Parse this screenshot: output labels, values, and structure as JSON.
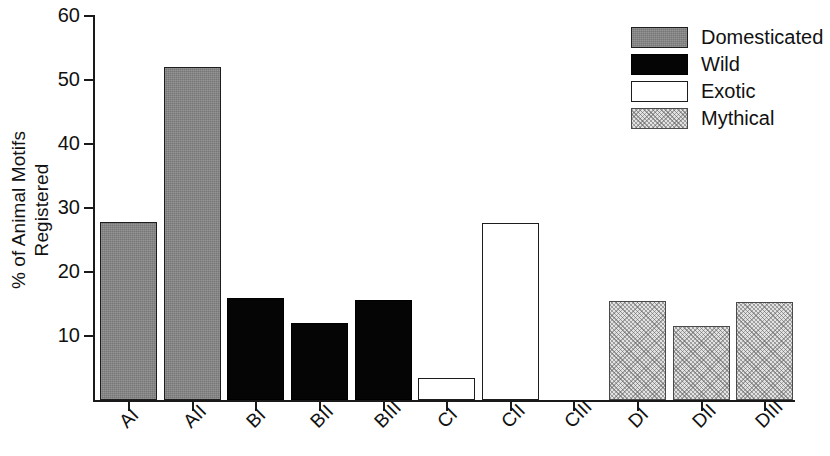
{
  "chart_data": {
    "type": "bar",
    "title": "",
    "subtitle": "",
    "xlabel": "",
    "ylabel": "% of Animal Motifs Registered",
    "ylabel_lines": [
      "% of Animal Motifs",
      "Registered"
    ],
    "categories": [
      "AI",
      "AII",
      "BI",
      "BII",
      "BIII",
      "CI",
      "CII",
      "CIII",
      "DI",
      "DII",
      "DIII"
    ],
    "values": [
      27.8,
      52.0,
      16.0,
      12.0,
      15.6,
      3.4,
      27.6,
      0,
      15.5,
      11.5,
      15.3
    ],
    "groups": [
      "Domesticated",
      "Domesticated",
      "Wild",
      "Wild",
      "Wild",
      "Exotic",
      "Exotic",
      "Exotic",
      "Mythical",
      "Mythical",
      "Mythical"
    ],
    "ylim": [
      0,
      60
    ],
    "yticks": [
      0,
      10,
      20,
      30,
      40,
      50,
      60
    ],
    "ytick_labels": [
      "",
      "10",
      "20",
      "30",
      "40",
      "50",
      "60"
    ],
    "grid": false,
    "legend_position": "top-right",
    "legend": [
      {
        "name": "Domesticated",
        "swatch": "domesticated",
        "color": "#858585"
      },
      {
        "name": "Wild",
        "swatch": "wild",
        "color": "#050505"
      },
      {
        "name": "Exotic",
        "swatch": "exotic",
        "color": "#ffffff"
      },
      {
        "name": "Mythical",
        "swatch": "mythical",
        "color": "#e2e2e2"
      }
    ]
  }
}
